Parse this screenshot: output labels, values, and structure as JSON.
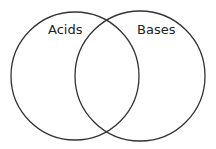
{
  "diagram": {
    "type": "venn",
    "sets": [
      {
        "label": "Acids"
      },
      {
        "label": "Bases"
      }
    ],
    "stroke_color": "#333333",
    "background": "#ffffff"
  }
}
